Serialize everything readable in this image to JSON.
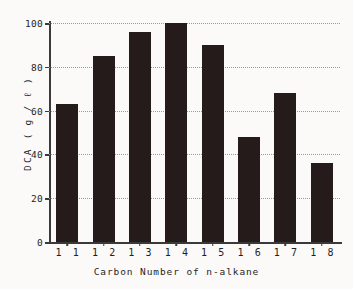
{
  "chart_data": {
    "type": "bar",
    "title": "",
    "subtitle": "",
    "xlabel": "Carbon Number of n-alkane",
    "ylabel": "DCA",
    "yunit": "( g / ℓ )",
    "ylabel_full": "DCA  ( g / ℓ )",
    "categories": [
      "1 1",
      "1 2",
      "1 3",
      "1 4",
      "1 5",
      "1 6",
      "1 7",
      "1 8"
    ],
    "category_values": [
      11,
      12,
      13,
      14,
      15,
      16,
      17,
      18
    ],
    "values": [
      63,
      85,
      96,
      100,
      90,
      48,
      68,
      36
    ],
    "ylim": [
      0,
      100
    ],
    "yticks": [
      0,
      20,
      40,
      60,
      80,
      100
    ],
    "ytick_labels": [
      "0",
      "20",
      "40",
      "60",
      "80",
      "100"
    ],
    "grid": "horizontal-dotted",
    "legend": "none",
    "bar_color": "#241b1a",
    "grid_color": "#9a9a96",
    "axis_color": "#3a3a3a",
    "background": "#fbfaf8"
  }
}
